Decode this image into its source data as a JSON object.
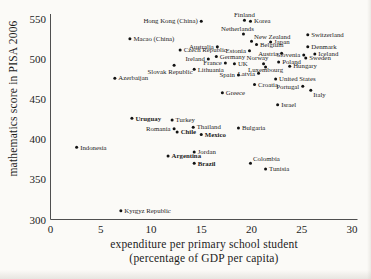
{
  "figure": {
    "background": "#fbfaf7",
    "text_color": "#1c1c1c",
    "axis_color": "#4f4f4f",
    "dot_color": "#121212"
  },
  "chart_data": {
    "type": "scatter",
    "title": "",
    "xlabel_line1": "expenditure per primary school student",
    "xlabel_line2": "(percentage of GDP per capita)",
    "ylabel": "mathematics score in PISA 2006",
    "xlim": [
      0,
      30
    ],
    "ylim": [
      300,
      550
    ],
    "xticks": [
      0,
      5,
      10,
      15,
      20,
      25,
      30
    ],
    "yticks": [
      300,
      350,
      400,
      450,
      500,
      550
    ],
    "grid": false,
    "legend": "none",
    "points": [
      {
        "name": "Finland",
        "x": 19.3,
        "score": 548,
        "placement": "above"
      },
      {
        "name": "Korea",
        "x": 19.9,
        "score": 547,
        "placement": "right"
      },
      {
        "name": "Hong Kong (China)",
        "x": 15.0,
        "score": 547,
        "placement": "left"
      },
      {
        "name": "Netherlands",
        "x": 19.2,
        "score": 531,
        "placement": "above-left"
      },
      {
        "name": "Switzerland",
        "x": 25.6,
        "score": 530,
        "placement": "right"
      },
      {
        "name": "Macao (China)",
        "x": 7.9,
        "score": 525,
        "placement": "right"
      },
      {
        "name": "New Zealand",
        "x": 20.0,
        "score": 522,
        "placement": "above-right"
      },
      {
        "name": "Japan",
        "x": 21.9,
        "score": 521,
        "placement": "right"
      },
      {
        "name": "Belgium",
        "x": 20.5,
        "score": 518,
        "placement": "right"
      },
      {
        "name": "Australia",
        "x": 16.6,
        "score": 515,
        "placement": "left"
      },
      {
        "name": "Czech Republic",
        "x": 12.9,
        "score": 511,
        "placement": "right"
      },
      {
        "name": "Estonia",
        "x": 19.8,
        "score": 510,
        "placement": "left"
      },
      {
        "name": "Austria",
        "x": 23.0,
        "score": 507,
        "placement": "left"
      },
      {
        "name": "Denmark",
        "x": 25.6,
        "score": 515,
        "placement": "right"
      },
      {
        "name": "Slovenia",
        "x": 25.2,
        "score": 505,
        "placement": "left"
      },
      {
        "name": "Iceland",
        "x": 26.3,
        "score": 506,
        "placement": "right"
      },
      {
        "name": "Germany",
        "x": 16.5,
        "score": 503,
        "placement": "right"
      },
      {
        "name": "Sweden",
        "x": 25.4,
        "score": 501,
        "placement": "right"
      },
      {
        "name": "Ireland",
        "x": 15.7,
        "score": 500,
        "placement": "left"
      },
      {
        "name": "France",
        "x": 17.4,
        "score": 495,
        "placement": "left"
      },
      {
        "name": "UK",
        "x": 18.3,
        "score": 494,
        "placement": "right"
      },
      {
        "name": "Norway",
        "x": 21.2,
        "score": 494,
        "placement": "above-left"
      },
      {
        "name": "Poland",
        "x": 22.7,
        "score": 496,
        "placement": "right"
      },
      {
        "name": "Hungary",
        "x": 23.8,
        "score": 491,
        "placement": "right"
      },
      {
        "name": "Slovak Republic",
        "x": 12.3,
        "score": 492,
        "placement": "below-left"
      },
      {
        "name": "Lithuania",
        "x": 14.3,
        "score": 487,
        "placement": "right"
      },
      {
        "name": "Luxembourg",
        "x": 21.4,
        "score": 490,
        "placement": "below",
        "oy": -3
      },
      {
        "name": "Latvia",
        "x": 20.7,
        "score": 482,
        "placement": "left"
      },
      {
        "name": "Spain",
        "x": 18.7,
        "score": 480,
        "placement": "left"
      },
      {
        "name": "Azerbaijan",
        "x": 6.4,
        "score": 476,
        "placement": "right"
      },
      {
        "name": "United States",
        "x": 22.4,
        "score": 475,
        "placement": "right"
      },
      {
        "name": "Croatia",
        "x": 20.3,
        "score": 468,
        "placement": "right"
      },
      {
        "name": "Portugal",
        "x": 25.1,
        "score": 466,
        "placement": "left"
      },
      {
        "name": "Italy",
        "x": 25.9,
        "score": 461,
        "placement": "below-right"
      },
      {
        "name": "Greece",
        "x": 17.1,
        "score": 458,
        "placement": "right"
      },
      {
        "name": "Israel",
        "x": 22.6,
        "score": 443,
        "placement": "right"
      },
      {
        "name": "Uruguay",
        "x": 8.1,
        "score": 426,
        "placement": "right",
        "bold": true
      },
      {
        "name": "Turkey",
        "x": 12.1,
        "score": 424,
        "placement": "right"
      },
      {
        "name": "Romania",
        "x": 12.3,
        "score": 413,
        "placement": "left"
      },
      {
        "name": "Thailand",
        "x": 14.2,
        "score": 415,
        "placement": "right"
      },
      {
        "name": "Chile",
        "x": 12.6,
        "score": 409,
        "placement": "right",
        "bold": true
      },
      {
        "name": "Mexico",
        "x": 15.0,
        "score": 406,
        "placement": "right",
        "bold": true
      },
      {
        "name": "Bulgaria",
        "x": 18.7,
        "score": 414,
        "placement": "right"
      },
      {
        "name": "Jordan",
        "x": 14.3,
        "score": 384,
        "placement": "right"
      },
      {
        "name": "Argentina",
        "x": 11.7,
        "score": 379,
        "placement": "right",
        "bold": true
      },
      {
        "name": "Brazil",
        "x": 14.3,
        "score": 370,
        "placement": "right",
        "bold": true
      },
      {
        "name": "Colombia",
        "x": 19.9,
        "score": 370,
        "placement": "above-right"
      },
      {
        "name": "Tunisia",
        "x": 21.4,
        "score": 363,
        "placement": "right"
      },
      {
        "name": "Indonesia",
        "x": 2.6,
        "score": 390,
        "placement": "right"
      },
      {
        "name": "Kyrgyz Republic",
        "x": 7.0,
        "score": 311,
        "placement": "right"
      }
    ]
  }
}
